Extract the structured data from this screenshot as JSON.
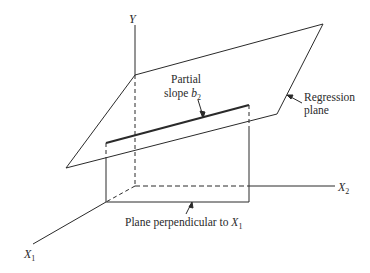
{
  "diagram": {
    "axes": {
      "y_label": "Y",
      "x1_label": "X",
      "x1_sub": "1",
      "x2_label": "X",
      "x2_sub": "2"
    },
    "annotations": {
      "partial_slope_line1": "Partial",
      "partial_slope_line2": "slope ",
      "partial_slope_var": "b",
      "partial_slope_sub": "2",
      "regression_line1": "Regression",
      "regression_line2": "plane",
      "perp_plane_text": "Plane perpendicular to ",
      "perp_plane_var": "X",
      "perp_plane_sub": "1"
    },
    "colors": {
      "ink": "#2a2a2a",
      "background": "#ffffff"
    }
  }
}
